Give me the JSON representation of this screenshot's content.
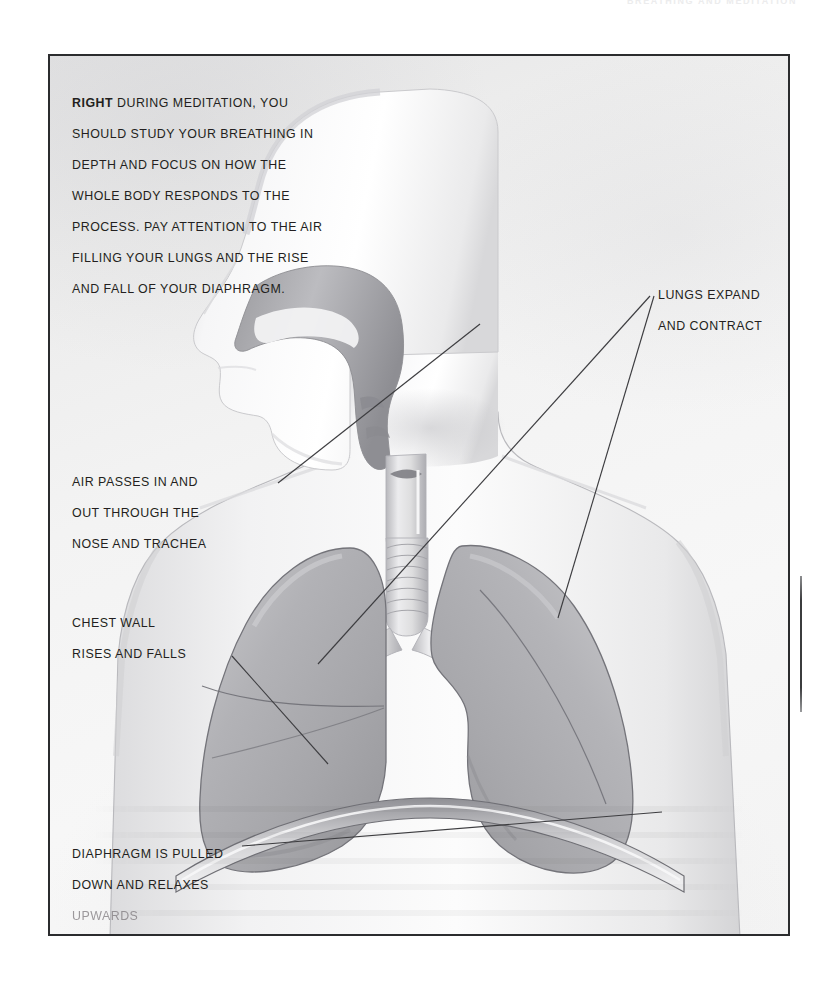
{
  "page": {
    "running_header": "BREATHING AND MEDITATION",
    "background_color": "#ffffff",
    "panel_border_color": "#2b2c2e",
    "text_color": "#231f20"
  },
  "caption": {
    "lead_word": "RIGHT",
    "body": " DURING MEDITATION, YOU SHOULD STUDY YOUR BREATHING IN DEPTH AND FOCUS ON HOW THE WHOLE BODY RESPONDS TO THE PROCESS. PAY ATTENTION TO THE AIR FILLING YOUR LUNGS AND THE RISE AND FALL OF YOUR DIAPHRAGM."
  },
  "annotations": {
    "air": "AIR PASSES IN AND\nOUT THROUGH THE\nNOSE AND TRACHEA",
    "chest": "CHEST WALL\nRISES AND FALLS",
    "diaphragm_main": "DIAPHRAGM IS PULLED\nDOWN AND RELAXES",
    "diaphragm_faded": "UPWARDS",
    "lungs": "LUNGS EXPAND\nAND CONTRACT"
  },
  "illustration": {
    "subject": "human-head-and-thorax-respiratory-system",
    "parts": [
      "head-profile",
      "nasal-cavity",
      "pharynx",
      "larynx",
      "trachea",
      "bronchi",
      "left-lung",
      "right-lung",
      "diaphragm",
      "chest-wall",
      "shoulders"
    ],
    "palette": {
      "body_light": "#fbfbfb",
      "body_shade": "#d6d6d8",
      "airway_gray": "#a9a9ac",
      "lung_gray": "#b6b6b9",
      "outline": "#6e6e72",
      "leader_line": "#3d3d40"
    }
  }
}
